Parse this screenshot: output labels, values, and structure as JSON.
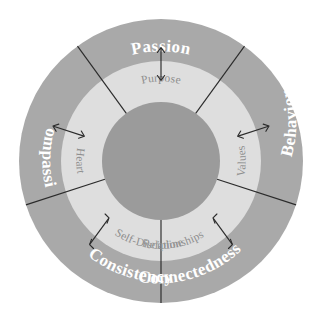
{
  "diagram": {
    "type": "concentric-ring-wheel",
    "segment_count": 5,
    "colors": {
      "background": "#ffffff",
      "outer_ring": "#a9a9a9",
      "inner_ring": "#dedede",
      "hub": "#9b9b9b",
      "outer_label_text": "#ffffff",
      "inner_label_text": "#8e8e8e",
      "divider": "#2b2b2b",
      "arrow": "#2b2b2b"
    },
    "geometry": {
      "center_x": 161,
      "center_y": 161,
      "hub_radius": 59,
      "inner_ring_outer_radius": 100,
      "outer_ring_outer_radius": 142
    },
    "segments": [
      {
        "id": "passion",
        "outer_label": "Passion",
        "inner_label": "Purpose",
        "center_angle_deg": 90,
        "start_angle_deg": 54,
        "end_angle_deg": 126
      },
      {
        "id": "behavior",
        "outer_label": "Behavior",
        "inner_label": "Values",
        "center_angle_deg": 18,
        "start_angle_deg": -18,
        "end_angle_deg": 54
      },
      {
        "id": "connectedness",
        "outer_label": "Connectedness",
        "inner_label": "Relationships",
        "center_angle_deg": -54,
        "start_angle_deg": -90,
        "end_angle_deg": -18
      },
      {
        "id": "consistency",
        "outer_label": "Consistency",
        "inner_label": "Self-Discipline",
        "center_angle_deg": -126,
        "start_angle_deg": -162,
        "end_angle_deg": -90
      },
      {
        "id": "compassion",
        "outer_label": "Compassion",
        "inner_label": "Heart",
        "center_angle_deg": 162,
        "start_angle_deg": 126,
        "end_angle_deg": 198
      }
    ]
  }
}
